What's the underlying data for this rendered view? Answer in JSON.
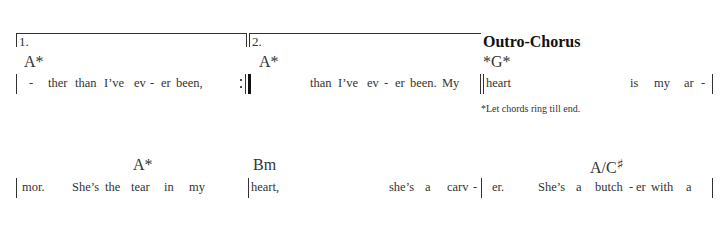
{
  "system1": {
    "volta1_label": "1.",
    "volta2_label": "2.",
    "section_title": "Outro-Chorus",
    "chords": [
      {
        "label": "A*"
      },
      {
        "label": "A*"
      },
      {
        "label": "*G*"
      }
    ],
    "measures": [
      {
        "lyrics": [
          "-",
          "ther",
          "than",
          "I’ve",
          "ev",
          "-",
          "er",
          "been,"
        ]
      },
      {
        "lyrics": [
          "than",
          "I’ve",
          "ev",
          "-",
          "er",
          "been.",
          "My"
        ]
      },
      {
        "lyrics": [
          "heart",
          "is",
          "my",
          "ar",
          "-"
        ]
      }
    ],
    "footnote": "*Let chords ring till end."
  },
  "system2": {
    "chords": [
      {
        "label": "A*"
      },
      {
        "label": "Bm"
      },
      {
        "label": "A/C",
        "accidental": "♯"
      }
    ],
    "measures": [
      {
        "lyrics": [
          "mor.",
          "She’s",
          "the",
          "tear",
          "in",
          "my"
        ]
      },
      {
        "lyrics": [
          "heart,",
          "she’s",
          "a",
          "carv",
          "-"
        ]
      },
      {
        "lyrics": [
          "er.",
          "She’s",
          "a",
          "butch",
          "-",
          "er",
          "with",
          "a"
        ]
      }
    ]
  }
}
